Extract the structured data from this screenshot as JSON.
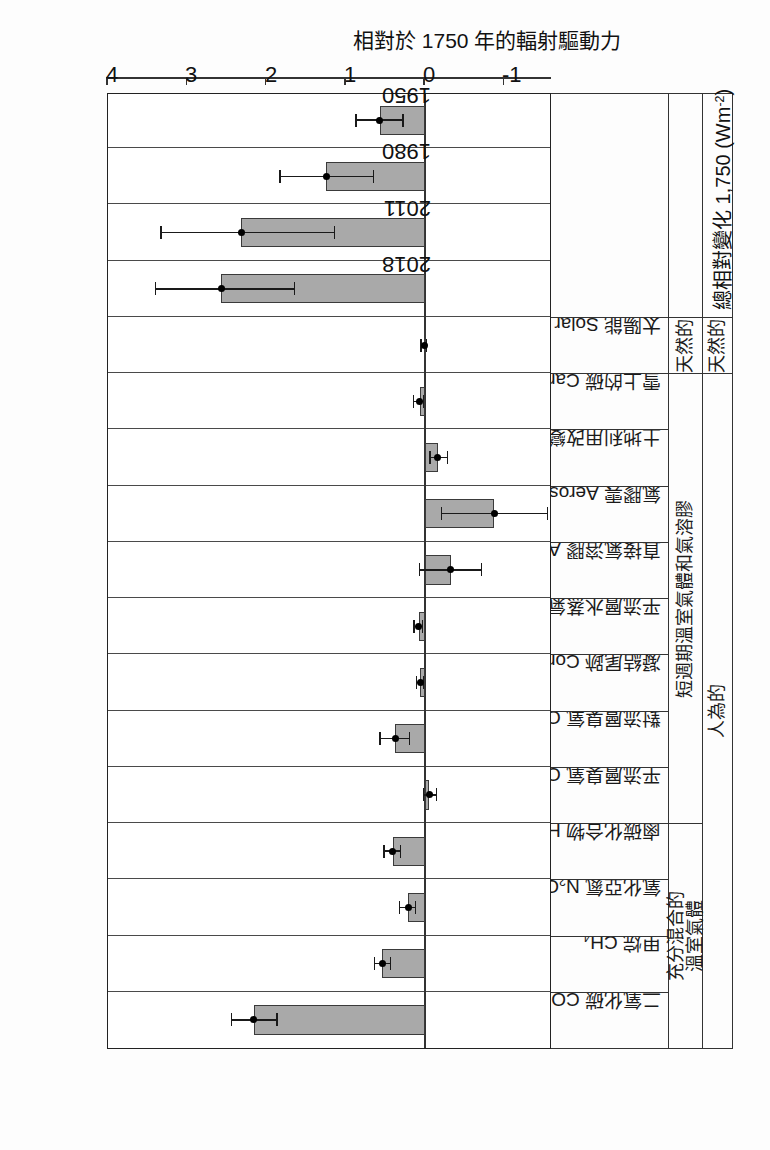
{
  "figure": {
    "header_label": "排放的化合物",
    "axis_title": "相對於 1750 年的輻射驅動力",
    "total_label": "總相對變化 1,750 (Wm-2)",
    "total_label_prefix": "總相對變化 1,750 (Wm",
    "total_label_exp": "-2",
    "total_label_suffix": ")",
    "bar_fill": "#a9a9a9",
    "bar_stroke": "#3a3a3a"
  },
  "groups": [
    {
      "label": "充分混合的\n溫室氣體",
      "span": 4
    },
    {
      "label": "短週期溫室氣體和氣溶膠",
      "span": 8
    },
    {
      "label": "天然的",
      "span": 1
    }
  ],
  "top_groups": [
    {
      "label": "人為的",
      "span": 12
    },
    {
      "label": "天然的",
      "span": 1
    },
    {
      "label": "總相對變化",
      "span": 4
    }
  ],
  "chart_data": {
    "type": "bar",
    "title": "",
    "xlabel": "排放的化合物",
    "ylabel": "相對於 1750 年的輻射驅動力 (Wm-2)",
    "ylim": [
      -1.6,
      4.0
    ],
    "yticks": [
      -1,
      0,
      1,
      2,
      3,
      4
    ],
    "ytick_labels": [
      "-1",
      "0",
      "1",
      "2",
      "3",
      "4"
    ],
    "grid": true,
    "orientation": "rotated-90",
    "categories": [
      "二氧化碳 CO2",
      "甲烷 CH4",
      "氧化亞氮 N2O",
      "鹵碳化合物 Halocarbons",
      "平流層臭氧 Ozone（Stratospheric）",
      "對流層臭氧 Ozone（Tropospheric）",
      "凝結尾跡 Contrails",
      "平流層水蒸氣 Stratospheric H2O",
      "直接氣溶膠 Aerosols - direct",
      "氣膠雲 Aerosols - clouds",
      "土地利用改變 landuse change",
      "雪上的碳 Carbon on snow",
      "太陽能 Solar",
      "2018",
      "2011",
      "1980",
      "1950"
    ],
    "category_labels_html": [
      "二氧化碳 CO<sub>2</sub>",
      "甲烷 CH<sub>4</sub>",
      "氧化亞氮 N<sub>2</sub>O",
      "鹵碳化合物 Halocarbons",
      "平流層臭氧 Ozone（Stratospheric）",
      "對流層臭氧 Ozone（Tropospheric）",
      "凝結尾跡 Contrails",
      "平流層水蒸氣 Stratospheric H<sub>2</sub>O",
      "直接氣溶膠 Aerosols - direct",
      "氣膠雲 Aerosols - clouds",
      "土地利用改變 landuse change",
      "雪上的碳 Carbon on snow",
      "太陽能 Solar"
    ],
    "values": [
      2.16,
      0.54,
      0.21,
      0.41,
      -0.05,
      0.38,
      0.06,
      0.08,
      -0.32,
      -0.87,
      -0.16,
      0.07,
      0.01,
      2.57,
      2.32,
      1.25,
      0.57
    ],
    "err_low": [
      1.87,
      0.44,
      0.12,
      0.31,
      -0.14,
      0.2,
      0.02,
      0.03,
      -0.71,
      -1.54,
      -0.28,
      0.02,
      -0.02,
      1.65,
      1.14,
      0.65,
      0.28
    ],
    "err_high": [
      2.44,
      0.64,
      0.32,
      0.52,
      0.02,
      0.57,
      0.11,
      0.14,
      0.07,
      -0.21,
      -0.06,
      0.15,
      0.05,
      3.4,
      3.33,
      1.83,
      0.87
    ],
    "total_series_labels": [
      "2018",
      "2011",
      "1980",
      "1950"
    ]
  }
}
